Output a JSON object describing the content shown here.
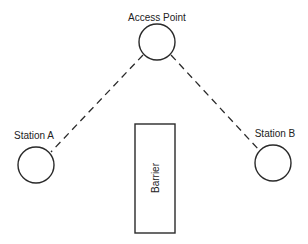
{
  "diagram": {
    "type": "network-topology",
    "nodes": [
      {
        "id": "ap",
        "label": "Access Point",
        "cx": 157,
        "cy": 42,
        "r": 18,
        "label_x": 157,
        "label_y": 17
      },
      {
        "id": "sta",
        "label": "Station A",
        "cx": 36,
        "cy": 165,
        "r": 18,
        "label_x": 35,
        "label_y": 137
      },
      {
        "id": "stb",
        "label": "Station B",
        "cx": 273,
        "cy": 163,
        "r": 18,
        "label_x": 274,
        "label_y": 135
      }
    ],
    "barrier": {
      "label": "Barrier",
      "x": 135,
      "y": 124,
      "width": 40,
      "height": 109
    },
    "links": [
      {
        "from": "ap",
        "to": "sta",
        "style": "dashed"
      },
      {
        "from": "ap",
        "to": "stb",
        "style": "dashed"
      }
    ],
    "colors": {
      "stroke": "#2a2a2a",
      "text": "#222222",
      "background": "#ffffff"
    }
  }
}
